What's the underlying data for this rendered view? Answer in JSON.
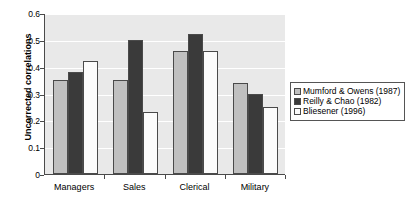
{
  "chart_data": {
    "type": "bar",
    "title": "",
    "xlabel": "",
    "ylabel": "Uncorrected correlations",
    "ylim": [
      0,
      0.6
    ],
    "yticks": [
      "0",
      "0.1",
      "0.2",
      "0.3",
      "0.4",
      "0.5",
      "0.6"
    ],
    "ytick_values": [
      0,
      0.1,
      0.2,
      0.3,
      0.4,
      0.5,
      0.6
    ],
    "grid": true,
    "legend_position": "right",
    "categories": [
      "Managers",
      "Sales",
      "Clerical",
      "Military"
    ],
    "series": [
      {
        "name": "Mumford & Owens (1987)",
        "color": "#c0c0c0",
        "values": [
          0.35,
          0.35,
          0.46,
          0.34
        ]
      },
      {
        "name": "Reilly & Chao (1982)",
        "color": "#3a3a3a",
        "values": [
          0.38,
          0.5,
          0.52,
          0.3
        ]
      },
      {
        "name": "Bliesener (1996)",
        "color": "#fbfbfb",
        "values": [
          0.42,
          0.23,
          0.46,
          0.25
        ]
      }
    ]
  },
  "colors": {
    "plot_background": "#e9e9e9",
    "gridline": "#ffffff",
    "axis": "#4a4a4a",
    "page_background": "#ffffff"
  }
}
